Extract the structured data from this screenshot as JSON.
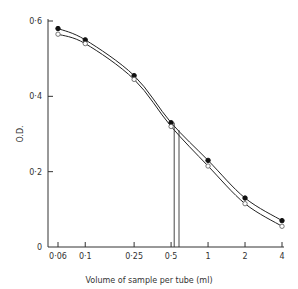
{
  "chart_data": {
    "type": "line",
    "title": "",
    "xlabel": "Volume of sample per tube (ml)",
    "ylabel": "O.D.",
    "xscale": "log",
    "x_tick_labels": [
      "0·06",
      "0·1",
      "0·25",
      "0·5",
      "1",
      "2",
      "4"
    ],
    "x_ticks": [
      0.06,
      0.1,
      0.25,
      0.5,
      1,
      2,
      4
    ],
    "y_tick_labels": [
      "0",
      "0·2",
      "0·4",
      "0·6"
    ],
    "y_ticks": [
      0,
      0.2,
      0.4,
      0.6
    ],
    "ylim": [
      0,
      0.6
    ],
    "xlim": [
      0.06,
      4
    ],
    "grid": false,
    "legend": null,
    "x": [
      0.06,
      0.1,
      0.25,
      0.5,
      1,
      2,
      4
    ],
    "series": [
      {
        "name": "filled-circles",
        "marker": "filled-circle",
        "values": [
          0.58,
          0.55,
          0.455,
          0.33,
          0.23,
          0.13,
          0.07
        ]
      },
      {
        "name": "open-circles",
        "marker": "open-circle",
        "values": [
          0.565,
          0.54,
          0.445,
          0.32,
          0.215,
          0.115,
          0.055
        ]
      }
    ],
    "annotations": [
      {
        "type": "vertical-line",
        "x": 0.53,
        "y_top": 0.33,
        "description": "drop line from filled curve at half-max"
      },
      {
        "type": "vertical-line",
        "x": 0.58,
        "y_top": 0.31,
        "description": "drop line from open curve at half-max"
      }
    ]
  }
}
